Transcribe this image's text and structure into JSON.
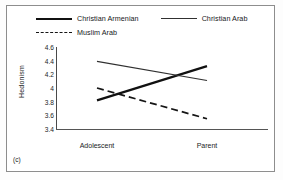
{
  "panel": {
    "label": "(c)"
  },
  "legend": {
    "items": [
      {
        "label": "Christian Armenian",
        "style": "thick-solid",
        "color": "#111111"
      },
      {
        "label": "Christian Arab",
        "style": "thin-solid",
        "color": "#303030"
      },
      {
        "label": "Muslim Arab",
        "style": "dashed",
        "color": "#151515"
      }
    ]
  },
  "chart_data": {
    "type": "line",
    "title": "",
    "xlabel": "",
    "ylabel": "Hedonism",
    "categories": [
      "Adolescent",
      "Parent"
    ],
    "yticks": [
      "3.4",
      "3.6",
      "3.8",
      "4",
      "4.2",
      "4.4",
      "4.6"
    ],
    "ylim": [
      3.4,
      4.6
    ],
    "grid": false,
    "legend_position": "top",
    "series": [
      {
        "name": "Christian Armenian",
        "values": [
          3.82,
          4.32
        ],
        "style": "thick-solid",
        "color": "#111111"
      },
      {
        "name": "Christian Arab",
        "values": [
          4.39,
          4.11
        ],
        "style": "thin-solid",
        "color": "#303030"
      },
      {
        "name": "Muslim Arab",
        "values": [
          4.0,
          3.55
        ],
        "style": "dashed",
        "color": "#151515"
      }
    ]
  }
}
